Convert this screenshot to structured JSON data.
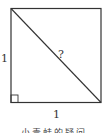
{
  "diagram": {
    "shape": "square",
    "side_left_label": "1",
    "side_bottom_label": "1",
    "diagonal_label": "?",
    "right_angle_marker": "bottom-left",
    "caption": "小青蛙的疑问"
  },
  "colors": {
    "stroke": "#333333",
    "background": "#ffffff"
  }
}
